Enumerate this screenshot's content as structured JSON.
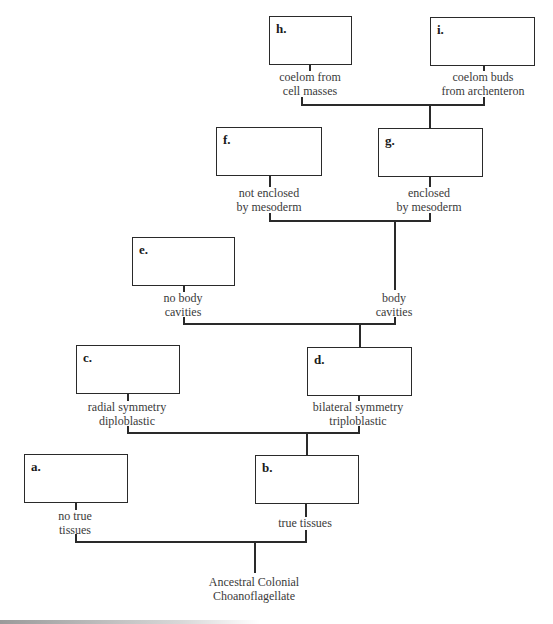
{
  "diagram": {
    "type": "phylogenetic-tree",
    "root": {
      "label_line1": "Ancestral Colonial",
      "label_line2": "Choanoflagellate"
    },
    "boxes": {
      "a": {
        "letter": "a."
      },
      "b": {
        "letter": "b."
      },
      "c": {
        "letter": "c."
      },
      "d": {
        "letter": "d."
      },
      "e": {
        "letter": "e."
      },
      "f": {
        "letter": "f."
      },
      "g": {
        "letter": "g."
      },
      "h": {
        "letter": "h."
      },
      "i": {
        "letter": "i."
      }
    },
    "branches": {
      "a": {
        "line1": "no true",
        "line2": "tissues"
      },
      "b": {
        "line1": "true tissues",
        "line2": ""
      },
      "c": {
        "line1": "radial symmetry",
        "line2": "diploblastic"
      },
      "d": {
        "line1": "bilateral symmetry",
        "line2": "triploblastic"
      },
      "e": {
        "line1": "no body",
        "line2": "cavities"
      },
      "body": {
        "line1": "body",
        "line2": "cavities"
      },
      "f": {
        "line1": "not enclosed",
        "line2": "by mesoderm"
      },
      "g": {
        "line1": "enclosed",
        "line2": "by mesoderm"
      },
      "h": {
        "line1": "coelom from",
        "line2": "cell masses"
      },
      "i": {
        "line1": "coelom buds",
        "line2": "from archenteron"
      }
    },
    "colors": {
      "line": "#2a2a2a",
      "text": "#3a3a3a",
      "background": "#ffffff"
    }
  }
}
